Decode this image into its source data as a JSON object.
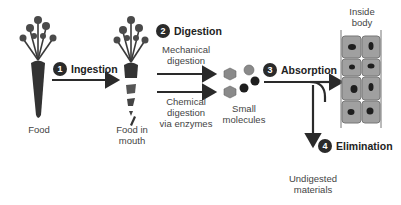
{
  "steps": [
    {
      "number": "1",
      "title": "Ingestion"
    },
    {
      "number": "2",
      "title": "Digestion"
    },
    {
      "number": "3",
      "title": "Absorption"
    },
    {
      "number": "4",
      "title": "Elimination"
    }
  ],
  "labels": {
    "food": "Food",
    "food_in_mouth_1": "Food in",
    "food_in_mouth_2": "mouth",
    "mechanical_1": "Mechanical",
    "mechanical_2": "digestion",
    "chemical_1": "Chemical",
    "chemical_2": "digestion",
    "chemical_3": "via enzymes",
    "small_molecules_1": "Small",
    "small_molecules_2": "molecules",
    "inside_body_1": "Inside",
    "inside_body_2": "body",
    "undigested_1": "Undigested",
    "undigested_2": "materials"
  },
  "colors": {
    "ink": "#2a2a2a",
    "cell_fill": "#9a9a9a",
    "cell_border": "#777777",
    "molecule_light": "#8a8a8a",
    "molecule_dark": "#1e1e1e"
  }
}
